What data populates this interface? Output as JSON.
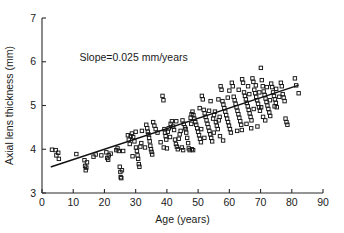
{
  "chart_data": {
    "type": "scatter",
    "title": "",
    "xlabel": "Age (years)",
    "ylabel": "Axial lens thickness (mm)",
    "xlim": [
      0,
      90
    ],
    "ylim": [
      3,
      7
    ],
    "xticks": [
      0,
      10,
      20,
      30,
      40,
      50,
      60,
      70,
      80,
      90
    ],
    "yticks": [
      3,
      4,
      5,
      6,
      7
    ],
    "xtick_labels": [
      "0",
      "10",
      "20",
      "30",
      "40",
      "50",
      "60",
      "70",
      "80",
      "90"
    ],
    "ytick_labels": [
      "3",
      "4",
      "5",
      "6",
      "7"
    ],
    "grid": false,
    "legend": false,
    "marker_style": "open-square",
    "marker_color": "#151515",
    "annotations": [
      {
        "name": "slope-annotation",
        "text": "Slope=0.025 mm/years",
        "x": 12.0,
        "y": 6.02
      }
    ],
    "fit_line": {
      "name": "regression-line",
      "slope": 0.025,
      "intercept": 3.525,
      "x_start": 3.0,
      "y_start": 3.6,
      "x_end": 82.0,
      "y_end": 5.46,
      "color": "#111111"
    },
    "series": [
      {
        "name": "Axial lens thickness vs age",
        "points": [
          [
            3.2,
            3.99
          ],
          [
            4.4,
            3.98
          ],
          [
            4.6,
            3.86
          ],
          [
            5.2,
            3.92
          ],
          [
            5.4,
            3.78
          ],
          [
            11.0,
            3.89
          ],
          [
            13.6,
            3.75
          ],
          [
            13.8,
            3.62
          ],
          [
            14.0,
            3.52
          ],
          [
            14.2,
            3.58
          ],
          [
            14.4,
            3.7
          ],
          [
            16.5,
            3.83
          ],
          [
            17.2,
            3.88
          ],
          [
            20.6,
            3.93
          ],
          [
            20.9,
            3.8
          ],
          [
            21.2,
            3.76
          ],
          [
            21.4,
            3.86
          ],
          [
            23.8,
            3.98
          ],
          [
            24.2,
            4.02
          ],
          [
            24.6,
            3.96
          ],
          [
            24.9,
            3.6
          ],
          [
            25.1,
            3.48
          ],
          [
            25.2,
            3.36
          ],
          [
            25.4,
            3.34
          ],
          [
            25.6,
            3.52
          ],
          [
            27.5,
            4.32
          ],
          [
            27.8,
            4.22
          ],
          [
            28.1,
            4.12
          ],
          [
            28.4,
            4.3
          ],
          [
            28.8,
            4.36
          ],
          [
            29.2,
            4.28
          ],
          [
            29.6,
            4.18
          ],
          [
            30.1,
            4.04
          ],
          [
            30.4,
            3.96
          ],
          [
            30.6,
            3.86
          ],
          [
            30.8,
            3.78
          ],
          [
            31.0,
            3.66
          ],
          [
            31.2,
            3.6
          ],
          [
            31.5,
            4.06
          ],
          [
            31.8,
            4.14
          ],
          [
            33.4,
            4.56
          ],
          [
            33.7,
            4.48
          ],
          [
            33.9,
            4.4
          ],
          [
            34.1,
            4.34
          ],
          [
            34.3,
            4.26
          ],
          [
            34.5,
            4.18
          ],
          [
            34.7,
            4.08
          ],
          [
            34.9,
            4.0
          ],
          [
            35.1,
            3.94
          ],
          [
            35.3,
            3.88
          ],
          [
            38.6,
            5.22
          ],
          [
            38.9,
            5.12
          ],
          [
            39.2,
            4.46
          ],
          [
            39.4,
            4.38
          ],
          [
            39.6,
            4.3
          ],
          [
            39.8,
            4.22
          ],
          [
            40.0,
            4.02
          ],
          [
            40.3,
            4.4
          ],
          [
            40.6,
            4.48
          ],
          [
            41.2,
            4.58
          ],
          [
            41.6,
            4.64
          ],
          [
            42.0,
            4.52
          ],
          [
            42.3,
            4.44
          ],
          [
            42.6,
            4.22
          ],
          [
            42.9,
            4.12
          ],
          [
            43.2,
            4.06
          ],
          [
            43.5,
            4.0
          ],
          [
            43.8,
            4.24
          ],
          [
            44.1,
            4.34
          ],
          [
            44.4,
            4.42
          ],
          [
            45.0,
            4.66
          ],
          [
            45.4,
            4.58
          ],
          [
            45.8,
            4.5
          ],
          [
            46.2,
            4.38
          ],
          [
            46.5,
            4.26
          ],
          [
            46.8,
            4.14
          ],
          [
            47.0,
            4.02
          ],
          [
            47.3,
            3.98
          ],
          [
            47.6,
            4.72
          ],
          [
            47.9,
            4.8
          ],
          [
            48.2,
            4.86
          ],
          [
            48.5,
            4.78
          ],
          [
            48.8,
            4.7
          ],
          [
            49.1,
            4.62
          ],
          [
            49.4,
            4.56
          ],
          [
            49.7,
            4.48
          ],
          [
            50.0,
            4.4
          ],
          [
            50.3,
            4.32
          ],
          [
            50.6,
            4.24
          ],
          [
            50.9,
            4.16
          ],
          [
            51.2,
            5.22
          ],
          [
            51.5,
            5.14
          ],
          [
            51.8,
            4.9
          ],
          [
            52.1,
            4.82
          ],
          [
            52.4,
            4.74
          ],
          [
            52.7,
            4.66
          ],
          [
            53.0,
            4.58
          ],
          [
            53.3,
            4.5
          ],
          [
            53.6,
            4.42
          ],
          [
            53.9,
            4.34
          ],
          [
            54.2,
            4.26
          ],
          [
            54.5,
            4.18
          ],
          [
            54.8,
            4.7
          ],
          [
            55.1,
            4.78
          ],
          [
            55.4,
            4.86
          ],
          [
            55.7,
            4.62
          ],
          [
            56.0,
            4.54
          ],
          [
            56.3,
            4.46
          ],
          [
            56.6,
            4.66
          ],
          [
            56.9,
            4.74
          ],
          [
            57.2,
            5.44
          ],
          [
            57.5,
            5.36
          ],
          [
            57.8,
            5.1
          ],
          [
            58.1,
            5.02
          ],
          [
            58.4,
            4.94
          ],
          [
            58.7,
            4.86
          ],
          [
            59.0,
            4.78
          ],
          [
            59.3,
            4.7
          ],
          [
            59.6,
            4.62
          ],
          [
            59.9,
            4.54
          ],
          [
            60.2,
            4.46
          ],
          [
            60.5,
            4.38
          ],
          [
            60.8,
            5.52
          ],
          [
            61.1,
            5.44
          ],
          [
            61.4,
            5.2
          ],
          [
            61.7,
            5.12
          ],
          [
            62.0,
            5.04
          ],
          [
            62.3,
            4.96
          ],
          [
            62.6,
            4.88
          ],
          [
            62.9,
            4.8
          ],
          [
            63.2,
            4.72
          ],
          [
            63.5,
            4.64
          ],
          [
            63.8,
            4.56
          ],
          [
            64.1,
            5.6
          ],
          [
            64.4,
            5.52
          ],
          [
            64.7,
            5.3
          ],
          [
            65.0,
            5.22
          ],
          [
            65.3,
            5.14
          ],
          [
            65.6,
            5.06
          ],
          [
            65.9,
            4.98
          ],
          [
            66.2,
            4.9
          ],
          [
            66.5,
            4.82
          ],
          [
            66.8,
            4.74
          ],
          [
            67.1,
            4.66
          ],
          [
            67.4,
            5.62
          ],
          [
            67.7,
            5.54
          ],
          [
            68.0,
            5.36
          ],
          [
            68.3,
            5.28
          ],
          [
            68.6,
            5.2
          ],
          [
            68.9,
            5.12
          ],
          [
            69.2,
            5.04
          ],
          [
            69.5,
            4.96
          ],
          [
            69.8,
            4.88
          ],
          [
            70.1,
            5.86
          ],
          [
            70.4,
            5.58
          ],
          [
            70.7,
            5.44
          ],
          [
            71.0,
            5.32
          ],
          [
            71.3,
            5.24
          ],
          [
            71.6,
            5.16
          ],
          [
            71.9,
            5.08
          ],
          [
            72.2,
            5.0
          ],
          [
            72.5,
            4.92
          ],
          [
            72.8,
            4.84
          ],
          [
            73.1,
            4.76
          ],
          [
            73.4,
            5.5
          ],
          [
            73.7,
            5.42
          ],
          [
            74.0,
            5.3
          ],
          [
            74.3,
            5.22
          ],
          [
            74.6,
            5.14
          ],
          [
            74.9,
            5.06
          ],
          [
            75.2,
            4.96
          ],
          [
            76.5,
            5.52
          ],
          [
            76.8,
            5.44
          ],
          [
            77.1,
            5.26
          ],
          [
            77.4,
            5.18
          ],
          [
            77.7,
            5.1
          ],
          [
            78.0,
            4.7
          ],
          [
            78.3,
            4.62
          ],
          [
            78.6,
            4.56
          ],
          [
            81.0,
            5.62
          ],
          [
            81.4,
            5.46
          ],
          [
            82.2,
            5.28
          ],
          [
            35.6,
            4.62
          ],
          [
            36.0,
            4.54
          ],
          [
            36.4,
            4.46
          ],
          [
            37.0,
            4.38
          ],
          [
            44.8,
            4.04
          ],
          [
            45.2,
            3.98
          ],
          [
            46.0,
            4.46
          ],
          [
            47.8,
            4.58
          ],
          [
            48.0,
            4.0
          ],
          [
            48.4,
            3.98
          ],
          [
            52.0,
            4.26
          ],
          [
            54.0,
            5.1
          ],
          [
            55.0,
            4.38
          ],
          [
            56.5,
            5.14
          ],
          [
            57.0,
            4.3
          ],
          [
            58.0,
            4.2
          ],
          [
            59.5,
            5.18
          ],
          [
            60.0,
            5.34
          ],
          [
            62.5,
            4.42
          ],
          [
            63.0,
            5.36
          ],
          [
            64.0,
            4.44
          ],
          [
            66.0,
            5.44
          ],
          [
            67.0,
            4.48
          ],
          [
            68.5,
            5.46
          ],
          [
            69.0,
            4.52
          ],
          [
            70.8,
            4.74
          ],
          [
            71.5,
            4.66
          ],
          [
            72.0,
            5.42
          ],
          [
            73.0,
            5.12
          ],
          [
            74.5,
            4.98
          ],
          [
            75.0,
            5.38
          ],
          [
            76.0,
            5.2
          ],
          [
            29.0,
            3.84
          ],
          [
            30.0,
            4.4
          ],
          [
            32.0,
            4.42
          ],
          [
            33.0,
            4.04
          ],
          [
            38.0,
            4.16
          ],
          [
            39.0,
            4.04
          ],
          [
            41.0,
            4.28
          ],
          [
            43.0,
            4.64
          ],
          [
            50.5,
            4.94
          ],
          [
            51.0,
            4.46
          ],
          [
            53.5,
            4.88
          ],
          [
            65.5,
            4.58
          ],
          [
            66.4,
            5.26
          ],
          [
            67.8,
            4.92
          ],
          [
            69.6,
            5.3
          ],
          [
            70.2,
            4.96
          ],
          [
            26.0,
            3.96
          ],
          [
            22.0,
            3.9
          ],
          [
            19.0,
            3.86
          ]
        ]
      }
    ]
  },
  "axes": {
    "x_axis_name": "x-axis",
    "y_axis_name": "y-axis"
  }
}
